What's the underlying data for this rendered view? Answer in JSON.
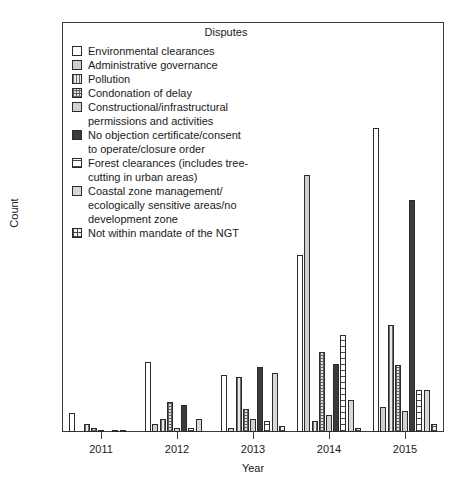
{
  "chart_data": {
    "type": "bar",
    "title": "",
    "xlabel": "Year",
    "ylabel": "Count",
    "ylim": [
      0,
      215
    ],
    "yticks": [
      0,
      50,
      100,
      150,
      200
    ],
    "ytick_labels": [
      "0",
      "50",
      "100",
      "150",
      "200"
    ],
    "categories": [
      "2011",
      "2012",
      "2013",
      "2014",
      "2015"
    ],
    "grid": false,
    "legend_position": "top-left inside plot",
    "legend_title": "Disputes",
    "series": [
      {
        "name": "Environmental clearances",
        "fill": "f0",
        "values": [
          10,
          37,
          30,
          93,
          160
        ]
      },
      {
        "name": "Administrative governance",
        "fill": "f1",
        "values": [
          0,
          4,
          2,
          135,
          13
        ]
      },
      {
        "name": "Pollution",
        "fill": "f2",
        "values": [
          4,
          7,
          29,
          6,
          56
        ]
      },
      {
        "name": "Condonation of delay",
        "fill": "f3",
        "values": [
          2,
          16,
          12,
          42,
          35
        ]
      },
      {
        "name": "Constructional/infrastructural permissions and activities",
        "fill": "f4",
        "values": [
          1,
          2,
          7,
          9,
          11
        ]
      },
      {
        "name": "No objection certificate/consent to operate/closure order",
        "fill": "f5",
        "values": [
          0,
          14,
          34,
          36,
          122
        ]
      },
      {
        "name": "Forest clearances (includes tree-cutting in urban areas)",
        "fill": "f6",
        "values": [
          1,
          2,
          6,
          51,
          22
        ]
      },
      {
        "name": "Coastal zone management/ecologically sensitive areas/no development zone",
        "fill": "f7",
        "values": [
          1,
          7,
          31,
          17,
          22
        ]
      },
      {
        "name": "Not within mandate of the NGT",
        "fill": "f8",
        "values": [
          0,
          0,
          3,
          2,
          4
        ]
      }
    ]
  },
  "legend": {
    "title": "Disputes",
    "entries": [
      {
        "label": "Environmental clearances",
        "cont": ""
      },
      {
        "label": "Administrative governance",
        "cont": ""
      },
      {
        "label": "Pollution",
        "cont": ""
      },
      {
        "label": "Condonation of delay",
        "cont": ""
      },
      {
        "label": "Constructional/infrastructural",
        "cont": "permissions and activities"
      },
      {
        "label": "No objection certificate/consent",
        "cont": "to operate/closure order"
      },
      {
        "label": "Forest clearances (includes tree-",
        "cont": "cutting in urban areas)"
      },
      {
        "label": "Coastal zone management/",
        "cont": "ecologically sensitive areas/no\ndevelopment zone"
      },
      {
        "label": "Not within mandate of the NGT",
        "cont": ""
      }
    ]
  },
  "axes": {
    "y_title": "Count",
    "x_title": "Year",
    "y_tick_labels": [
      "0",
      "50",
      "100",
      "150",
      "200"
    ],
    "x_tick_labels": [
      "2011",
      "2012",
      "2013",
      "2014",
      "2015"
    ]
  },
  "colors": {
    "axis": "#3a3a3a",
    "bar_outline": "#2b2b2b",
    "dark_fill": "#3b3b3b",
    "light_fill": "#d2d2d2",
    "background": "#ffffff"
  }
}
